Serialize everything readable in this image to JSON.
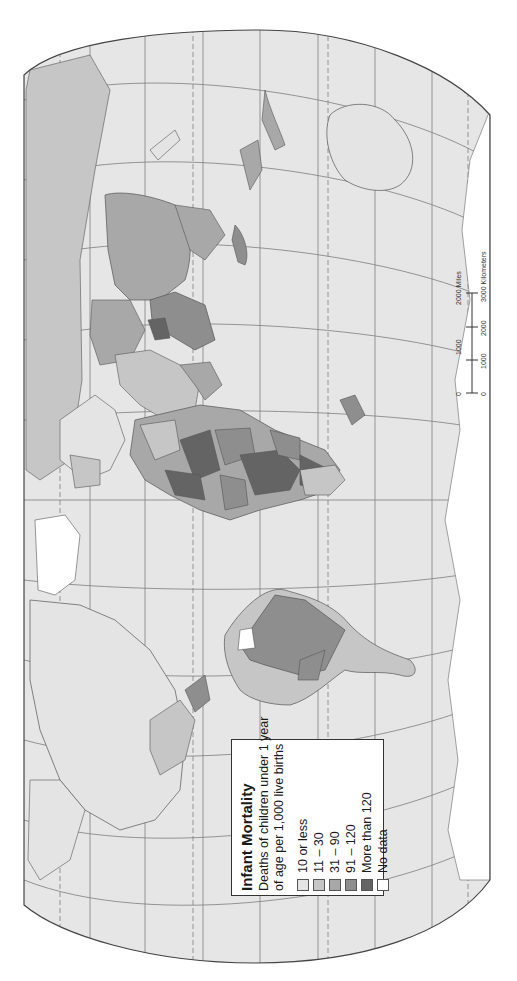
{
  "map": {
    "type": "world choropleth",
    "orientation": "rotated 90° counter-clockwise",
    "colors": {
      "ocean": "#e6e6e6",
      "graticule": "#7d7d7d",
      "frame": "#444444",
      "border": "#555555",
      "page_background": "#ffffff"
    }
  },
  "legend": {
    "title": "Infant Mortality",
    "subtitle_line1": "Deaths of children under 1 year",
    "subtitle_line2": "of age per 1,000 live births",
    "items": [
      {
        "label": "10 or less",
        "color": "#e4e4e4"
      },
      {
        "label": "11 – 30",
        "color": "#c6c6c6"
      },
      {
        "label": "31 – 90",
        "color": "#a8a8a8"
      },
      {
        "label": "91 – 120",
        "color": "#8e8e8e"
      },
      {
        "label": "More than 120",
        "color": "#646464"
      },
      {
        "label": "No data",
        "color": "#ffffff"
      }
    ]
  },
  "scale_bar": {
    "miles_label": "2000 Miles",
    "miles_ticks": [
      "0",
      "1000"
    ],
    "km_label": "3000 Kilometers",
    "km_ticks": [
      "0",
      "1000",
      "2000"
    ]
  }
}
